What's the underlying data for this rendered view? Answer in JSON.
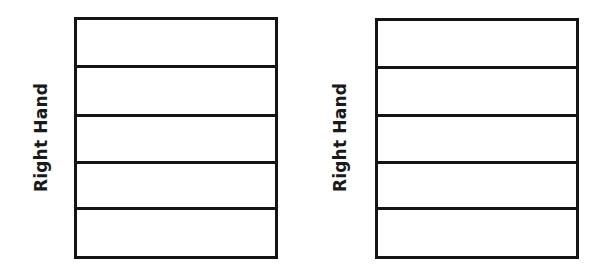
{
  "figure": {
    "background_color": "#ffffff",
    "line_color": "#141414",
    "text_color": "#1a1a1a"
  },
  "panels": [
    {
      "id": "left",
      "axis_label": "Right Hand",
      "rows": [
        {
          "index": 1,
          "value": ""
        },
        {
          "index": 2,
          "value": ""
        },
        {
          "index": 3,
          "value": ""
        },
        {
          "index": 4,
          "value": ""
        },
        {
          "index": 5,
          "value": ""
        }
      ]
    },
    {
      "id": "right",
      "axis_label": "Right Hand",
      "rows": [
        {
          "index": 1,
          "value": ""
        },
        {
          "index": 2,
          "value": ""
        },
        {
          "index": 3,
          "value": ""
        },
        {
          "index": 4,
          "value": ""
        },
        {
          "index": 5,
          "value": ""
        }
      ]
    }
  ],
  "chart_data": {
    "type": "table",
    "title": "",
    "subtitle": "",
    "xlabel": "",
    "ylabel": "Right Hand",
    "grid": true,
    "legend_position": "none",
    "annotations": [],
    "panel_count": 2,
    "columns": [
      ""
    ],
    "rows_per_panel": 5,
    "cells": [
      {
        "panel": "left",
        "values": [
          "",
          "",
          "",
          "",
          ""
        ]
      },
      {
        "panel": "right",
        "values": [
          "",
          "",
          "",
          "",
          ""
        ]
      }
    ],
    "tick_labels": [],
    "series": []
  }
}
